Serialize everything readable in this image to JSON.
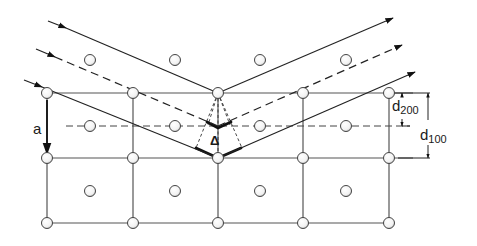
{
  "diagram": {
    "type": "bragg-diffraction-fcc-lattice",
    "labels": {
      "a": "a",
      "delta": "Δ",
      "d200_main": "d",
      "d200_sub": "200",
      "d100_main": "d",
      "d100_sub": "100"
    },
    "colors": {
      "line": "#333333",
      "atom_fill": "#ffffff",
      "atom_stroke": "#444444",
      "background": "#ffffff",
      "thick_marker": "#111111"
    },
    "lattice": {
      "columns_x": [
        47,
        133,
        218,
        303,
        389
      ],
      "rows_y": [
        93,
        158,
        223
      ],
      "face_center_x": [
        90,
        175,
        260,
        346
      ],
      "face_center_y": [
        60,
        126,
        191
      ]
    },
    "rays": {
      "incoming": [
        {
          "style": "solid",
          "from": [
            48,
            21
          ],
          "to": [
            218,
            93
          ]
        },
        {
          "style": "dashed",
          "from": [
            36,
            49
          ],
          "to": [
            218,
            126
          ]
        },
        {
          "style": "solid",
          "from": [
            24,
            80
          ],
          "to": [
            218,
            158
          ]
        }
      ],
      "outgoing": [
        {
          "style": "solid",
          "from": [
            218,
            93
          ],
          "to": [
            393,
            18
          ]
        },
        {
          "style": "dashed",
          "from": [
            218,
            126
          ],
          "to": [
            402,
            45
          ]
        },
        {
          "style": "solid",
          "from": [
            218,
            158
          ],
          "to": [
            415,
            72
          ]
        }
      ]
    }
  }
}
